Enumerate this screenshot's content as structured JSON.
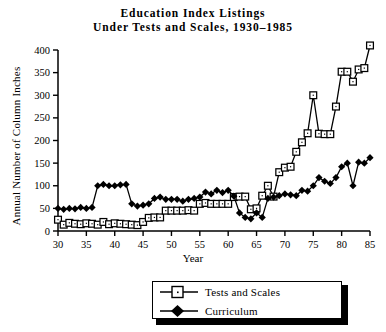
{
  "chart_data": {
    "type": "line",
    "title": "Education Index Listings Under Tests and Scales, 1930–1985",
    "title_lines": [
      "Education Index Listings",
      "Under Tests and Scales, 1930–1985"
    ],
    "xlabel": "Year",
    "ylabel": "Annual Number of Column Inches",
    "xlim": [
      30,
      85
    ],
    "ylim": [
      0,
      400
    ],
    "xticks": [
      30,
      35,
      40,
      45,
      50,
      55,
      60,
      65,
      70,
      75,
      80,
      85
    ],
    "xtick_labels": [
      "30",
      "35",
      "40",
      "45",
      "50",
      "55",
      "60",
      "65",
      "70",
      "75",
      "80",
      "85"
    ],
    "yticks": [
      0,
      50,
      100,
      150,
      200,
      250,
      300,
      350,
      400
    ],
    "ytick_labels": [
      "0",
      "50",
      "100",
      "150",
      "200",
      "250",
      "300",
      "350",
      "400"
    ],
    "grid": false,
    "legend_position": "bottom-center",
    "x": [
      30,
      31,
      32,
      33,
      34,
      35,
      36,
      37,
      38,
      39,
      40,
      41,
      42,
      43,
      44,
      45,
      46,
      47,
      48,
      49,
      50,
      51,
      52,
      53,
      54,
      55,
      56,
      57,
      58,
      59,
      60,
      61,
      62,
      63,
      64,
      65,
      66,
      67,
      68,
      69,
      70,
      71,
      72,
      73,
      74,
      75,
      76,
      77,
      78,
      79,
      80,
      81,
      82,
      83,
      84,
      85
    ],
    "series": [
      {
        "name": "Tests and Scales",
        "marker": "open-square",
        "color": "#000000",
        "values": [
          25,
          14,
          18,
          16,
          15,
          17,
          16,
          14,
          20,
          15,
          17,
          16,
          15,
          14,
          13,
          20,
          29,
          30,
          30,
          45,
          45,
          45,
          45,
          46,
          45,
          60,
          62,
          60,
          60,
          60,
          60,
          75,
          76,
          76,
          48,
          50,
          78,
          100,
          76,
          130,
          140,
          142,
          175,
          196,
          216,
          300,
          215,
          214,
          214,
          275,
          352,
          352,
          330,
          357,
          360,
          410
        ]
      },
      {
        "name": "Curriculum",
        "marker": "filled-diamond",
        "color": "#000000",
        "values": [
          50,
          48,
          50,
          49,
          52,
          50,
          52,
          100,
          103,
          100,
          100,
          102,
          103,
          60,
          55,
          57,
          60,
          72,
          75,
          70,
          70,
          70,
          66,
          70,
          72,
          75,
          86,
          82,
          90,
          85,
          90,
          77,
          40,
          30,
          27,
          40,
          30,
          72,
          75,
          78,
          82,
          80,
          78,
          90,
          88,
          100,
          118,
          110,
          105,
          118,
          142,
          150,
          100,
          152,
          150,
          162
        ]
      }
    ],
    "legend": [
      {
        "label": "Tests and Scales",
        "marker": "open-square"
      },
      {
        "label": "Curriculum",
        "marker": "filled-diamond"
      }
    ]
  }
}
